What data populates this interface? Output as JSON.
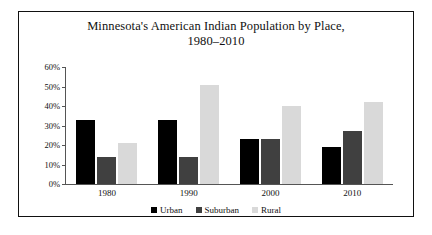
{
  "chart_data": {
    "type": "bar",
    "title": "Minnesota's American Indian Population by Place,",
    "title_line2": "1980–2010",
    "subtitle": "",
    "xlabel": "",
    "ylabel": "",
    "categories": [
      "1980",
      "1990",
      "2000",
      "2010"
    ],
    "series": [
      {
        "name": "Urban",
        "color": "#000000",
        "values": [
          33,
          33,
          23,
          19
        ]
      },
      {
        "name": "Suburban",
        "color": "#404040",
        "values": [
          14,
          14,
          23,
          27
        ]
      },
      {
        "name": "Rural",
        "color": "#d9d9d9",
        "values": [
          21,
          51,
          40,
          42
        ]
      }
    ],
    "ylim": [
      0,
      60
    ],
    "ytick_values": [
      0,
      10,
      20,
      30,
      40,
      50,
      60
    ],
    "ytick_labels": [
      "0%",
      "10%",
      "20%",
      "30%",
      "40%",
      "50%",
      "60%"
    ],
    "grid": false,
    "legend_position": "bottom"
  },
  "figure": {
    "border_color": "#111111",
    "background": "#ffffff",
    "axis_color": "#555555"
  }
}
